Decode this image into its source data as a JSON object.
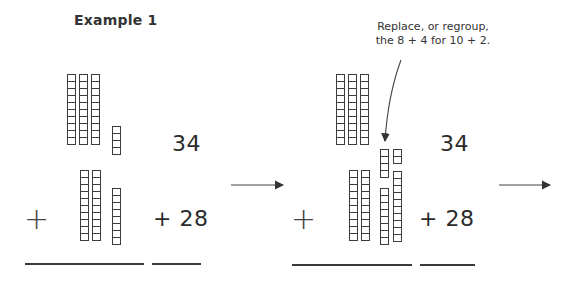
{
  "title": "Example 1",
  "annotation": {
    "line1": "Replace, or regroup,",
    "line2": "the 8 + 4 for 10 + 2."
  },
  "panels": [
    {
      "addend_top": "34",
      "addend_bottom": "+ 28",
      "plus_symbol": "+",
      "blocks_top": {
        "tens": 3,
        "ones": 4
      },
      "blocks_bottom": {
        "tens": 2,
        "ones": 8
      }
    },
    {
      "addend_top": "34",
      "addend_bottom": "+ 28",
      "plus_symbol": "+",
      "blocks_top": {
        "tens": 3
      },
      "blocks_bottom": {
        "tens": 2
      },
      "regrouped_ones": {
        "left_stack": [
          4,
          8
        ],
        "right_stack": [
          2,
          10
        ]
      }
    }
  ],
  "arrows": [
    "right-arrow",
    "right-arrow",
    "curved-arrow"
  ],
  "colors": {
    "ink": "#3c3c3c",
    "background": "#ffffff"
  }
}
